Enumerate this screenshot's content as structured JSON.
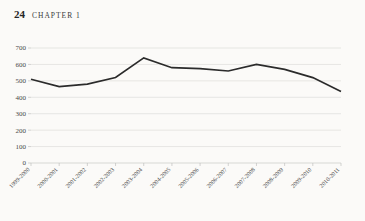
{
  "page": {
    "folio": "24",
    "chapter_label": "CHAPTER 1",
    "background_color": "#fbfaf8",
    "text_color": "#2e2e2e"
  },
  "chart_data": {
    "type": "line",
    "title": "",
    "subtitle": "",
    "xlabel": "",
    "ylabel": "",
    "categories": [
      "1999-2000",
      "2000-2001",
      "2001-2002",
      "2002-2003",
      "2003-2004",
      "2004-2005",
      "2005-2006",
      "2006-2007",
      "2007-2008",
      "2008-2009",
      "2009-2010",
      "2010-2011"
    ],
    "values": [
      510,
      465,
      480,
      520,
      640,
      580,
      575,
      560,
      600,
      570,
      520,
      435
    ],
    "series": [
      {
        "name": "series-1",
        "values": [
          510,
          465,
          480,
          520,
          640,
          580,
          575,
          560,
          600,
          570,
          520,
          435
        ],
        "color": "#2b2b2b"
      }
    ],
    "ylim": [
      0,
      700
    ],
    "yticks": [
      0,
      100,
      200,
      300,
      400,
      500,
      600,
      700
    ],
    "ytick_labels": [
      "0",
      "100",
      "200",
      "300",
      "400",
      "500",
      "600",
      "700"
    ],
    "grid": true,
    "grid_color": "#dcdcda",
    "legend": false,
    "legend_position": "none",
    "xtick_rotation": -45,
    "line_color": "#2b2b2b"
  }
}
